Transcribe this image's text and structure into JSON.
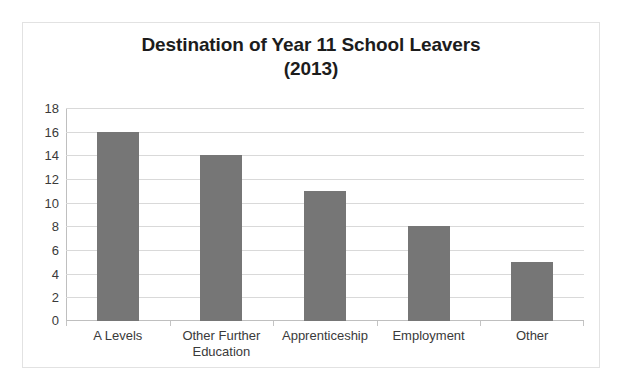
{
  "chart_data": {
    "type": "bar",
    "title": "Destination of Year 11 School Leavers (2013)",
    "title_lines": [
      "Destination of Year 11 School Leavers",
      "(2013)"
    ],
    "categories": [
      "A Levels",
      "Other Further Education",
      "Apprenticeship",
      "Employment",
      "Other"
    ],
    "category_lines": [
      [
        "A Levels"
      ],
      [
        "Other Further",
        "Education"
      ],
      [
        "Apprenticeship"
      ],
      [
        "Employment"
      ],
      [
        "Other"
      ]
    ],
    "values": [
      16,
      14,
      11,
      8,
      5
    ],
    "xlabel": "",
    "ylabel": "",
    "ylim": [
      0,
      18
    ],
    "ytick_step": 2,
    "yticks": [
      18,
      16,
      14,
      12,
      10,
      8,
      6,
      4,
      2,
      0
    ],
    "grid": true,
    "legend": false,
    "legend_position": "none",
    "colors": {
      "bar_fill": "#767676",
      "gridline": "#d9d9d9",
      "axis_line": "#bfbfbf",
      "title_text": "#1c1c1c",
      "tick_text": "#3a3a3a",
      "frame_border": "#e2e2e2",
      "background": "#ffffff"
    }
  }
}
